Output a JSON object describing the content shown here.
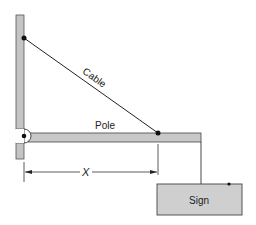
{
  "diagram": {
    "labels": {
      "cable": "Cable",
      "pole": "Pole",
      "dimension": "X",
      "sign": "Sign"
    },
    "colors": {
      "member_fill": "#c8c8c8",
      "stroke": "#333333",
      "sign_fill": "#cfcfcf"
    }
  }
}
